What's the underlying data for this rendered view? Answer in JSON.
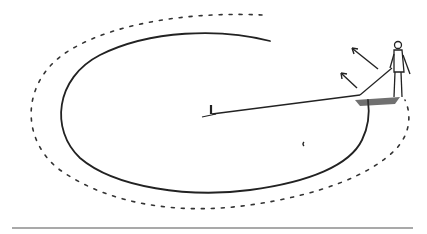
{
  "illustration": {
    "description": "Line drawing of a person at the edge of a circular field holding a rope tethered to a central stake, sweeping around in a circle; dotted outer path and arrows indicate direction of movement",
    "colors": {
      "ink": "#222222",
      "background": "#ffffff",
      "ground_line": "#555555"
    },
    "elements": [
      "inner-circle-path",
      "outer-dotted-path",
      "center-stake",
      "tether-rope",
      "person",
      "direction-arrows",
      "ground-line"
    ]
  }
}
